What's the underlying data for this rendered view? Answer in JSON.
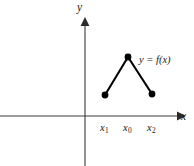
{
  "figure": {
    "background_color": "#ffffff",
    "width": 194,
    "height": 166,
    "axes": {
      "x_axis_label": "x",
      "y_axis_label": "y",
      "origin_x": 85,
      "origin_y": 116,
      "axis_color": "#3a3a3a"
    },
    "curve_label": {
      "full": "y = f(x)",
      "lhs": "y",
      "equals": "=",
      "rhs_function": "f",
      "rhs_open": "(",
      "rhs_arg": "x",
      "rhs_close": ")",
      "color": "#1a1a1a"
    },
    "tick_labels": [
      {
        "base": "x",
        "subscript": "1",
        "text": "x1"
      },
      {
        "base": "x",
        "subscript": "0",
        "text": "x0"
      },
      {
        "base": "x",
        "subscript": "2",
        "text": "x2"
      }
    ]
  },
  "chart_data": {
    "type": "line",
    "title": "",
    "subtitle": "",
    "xlabel": "x",
    "ylabel": "y",
    "annotations": [
      "y = f(x)"
    ],
    "grid": false,
    "legend": false,
    "legend_position": "none",
    "axis_style": "arrowed-cartesian",
    "xlim": [
      0,
      194
    ],
    "ylim": [
      0,
      166
    ],
    "tick_labels_x": [
      "x1",
      "x0",
      "x2"
    ],
    "tick_labels_y": [],
    "series": [
      {
        "name": "f(x)",
        "kind": "piecewise-linear",
        "marker": "filled-circle",
        "marker_color": "#000000",
        "line_color": "#000000",
        "line_width": 2.1,
        "points_px": [
          {
            "x": 105,
            "y": 95,
            "label": "x1"
          },
          {
            "x": 128,
            "y": 57,
            "label": "x0"
          },
          {
            "x": 152,
            "y": 94,
            "label": "x2"
          }
        ],
        "x": [
          "x1",
          "x0",
          "x2"
        ],
        "values": [
          21,
          59,
          22
        ]
      }
    ]
  }
}
